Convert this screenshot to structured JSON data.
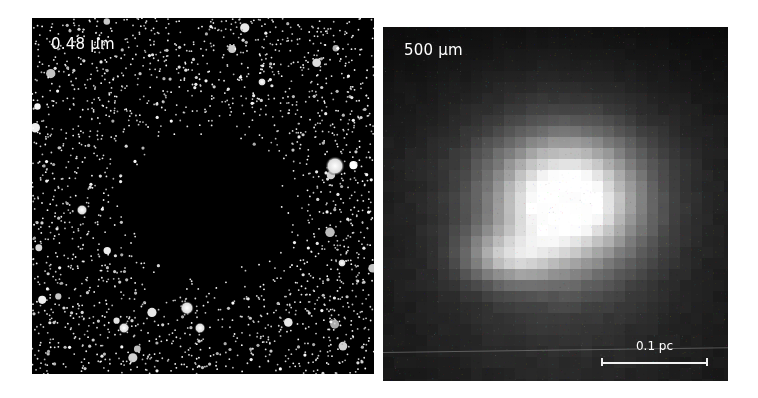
{
  "figure": {
    "panels": [
      {
        "id": "optical",
        "label": "0.48 μm",
        "description": "Optical starfield with dark globule obscuring background stars in center"
      },
      {
        "id": "submm",
        "label": "500 μm",
        "description": "Pixelated submillimeter dust emission map with bright central peak",
        "scalebar": {
          "label": "0.1 pc"
        }
      }
    ],
    "colors": {
      "background": "#ffffff",
      "label_text": "#ffffff",
      "optical_bg": "#000000",
      "submm_bg": "#1a1a1a",
      "submm_peak": "#ffffff"
    }
  }
}
